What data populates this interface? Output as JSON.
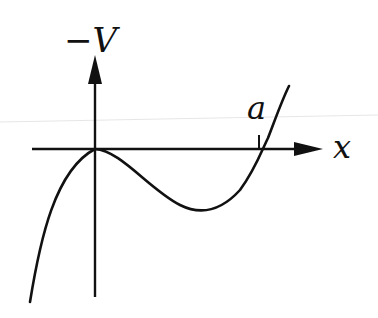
{
  "diagram": {
    "title": "",
    "y_axis_label": "−V",
    "x_axis_label": "x",
    "point_label": "a",
    "colors": {
      "stroke": "#111111",
      "background": "#ffffff"
    },
    "curve": {
      "description": "Cubic-like curve: rises from lower-left, touches a local maximum at the origin (on the x-axis), dips to a local minimum below the axis, then rises and crosses the x-axis at x = a",
      "features": [
        {
          "name": "local-maximum",
          "at": "origin",
          "value": 0
        },
        {
          "name": "local-minimum",
          "at": "between 0 and a",
          "value": "negative"
        },
        {
          "name": "root",
          "at": "a"
        }
      ]
    }
  }
}
